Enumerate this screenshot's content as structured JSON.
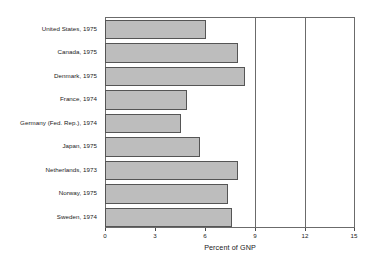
{
  "chart_data": {
    "type": "bar",
    "orientation": "horizontal",
    "title": "",
    "xlabel": "Percent of GNP",
    "ylabel": "",
    "xlim": [
      0,
      15
    ],
    "ylim": null,
    "grid": "vertical gridlines at 9 and 12",
    "legend": "none",
    "xticks": [
      "0",
      "3",
      "6",
      "9",
      "12",
      "15"
    ],
    "xtick_values": [
      0,
      3,
      6,
      9,
      12,
      15
    ],
    "categories": [
      "United States, 1975",
      "Canada, 1975",
      "Denmark, 1975",
      "France, 1974",
      "Germany (Fed. Rep.), 1974",
      "Japan, 1975",
      "Netherlands, 1973",
      "Norway, 1975",
      "Sweden, 1974"
    ],
    "values": [
      6.0,
      7.9,
      8.35,
      4.85,
      4.5,
      5.65,
      7.9,
      7.3,
      7.55
    ],
    "bar_fill_color": "#bdbdbd",
    "bar_border_color": "#555555",
    "frame_color": "#6b6b6b",
    "background_color": "#ffffff"
  }
}
